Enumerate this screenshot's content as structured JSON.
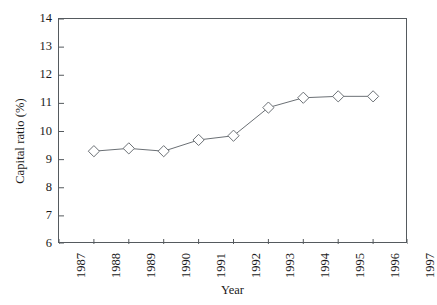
{
  "chart_data": {
    "type": "line",
    "title": "",
    "subtitle": "",
    "xlabel": "Year",
    "ylabel": "Capital ratio (%)",
    "x": [
      1988,
      1989,
      1990,
      1991,
      1992,
      1993,
      1994,
      1995,
      1996
    ],
    "values": [
      9.3,
      9.4,
      9.3,
      9.7,
      9.85,
      10.85,
      11.2,
      11.25,
      11.25
    ],
    "series": [
      {
        "name": "Capital ratio",
        "x": [
          1988,
          1989,
          1990,
          1991,
          1992,
          1993,
          1994,
          1995,
          1996
        ],
        "values": [
          9.3,
          9.4,
          9.3,
          9.7,
          9.85,
          10.85,
          11.2,
          11.25,
          11.25
        ]
      }
    ],
    "xlim": [
      1987,
      1997
    ],
    "ylim": [
      6,
      14
    ],
    "x_ticks": [
      1987,
      1988,
      1989,
      1990,
      1991,
      1992,
      1993,
      1994,
      1995,
      1996,
      1997
    ],
    "x_tick_labels": [
      "1987",
      "1988",
      "1989",
      "1990",
      "1991",
      "1992",
      "1993",
      "1994",
      "1995",
      "1996",
      "1997"
    ],
    "y_ticks": [
      6,
      7,
      8,
      9,
      10,
      11,
      12,
      13,
      14
    ],
    "y_tick_labels": [
      "6",
      "7",
      "8",
      "9",
      "10",
      "11",
      "12",
      "13",
      "14"
    ],
    "grid": false,
    "legend": false,
    "legend_position": "none",
    "marker": "diamond-open",
    "line_color": "#6b7075",
    "marker_edge_color": "#6b7075",
    "marker_face_color": "#ffffff",
    "axis_color": "#555a5e",
    "text_color": "#1a1a1a",
    "background_color": "#ffffff",
    "x_tick_label_rotation": 90,
    "y_label_rotation": 90
  }
}
